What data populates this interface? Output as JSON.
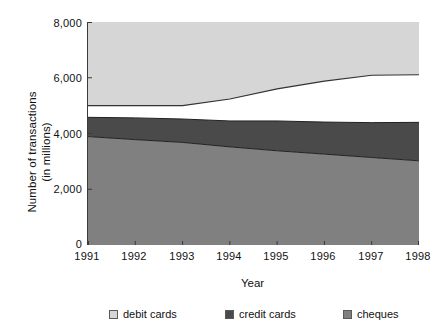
{
  "chart_data": {
    "type": "area",
    "stacked": true,
    "title": "",
    "xlabel": "Year",
    "ylabel": "Number of transactions\n(in millions)",
    "ylabel_line1": "Number of transactions",
    "ylabel_line2": "(in millions)",
    "categories": [
      "1991",
      "1992",
      "1993",
      "1994",
      "1995",
      "1996",
      "1997",
      "1998"
    ],
    "x": [
      1991,
      1992,
      1993,
      1994,
      1995,
      1996,
      1997,
      1998
    ],
    "ylim": [
      0,
      8000
    ],
    "yticks": [
      0,
      2000,
      4000,
      6000,
      8000
    ],
    "ytick_labels": [
      "0",
      "2,000",
      "4,000",
      "6,000",
      "8,000"
    ],
    "grid": false,
    "legend_position": "bottom",
    "stack_order_bottom_to_top": [
      "cheques",
      "credit cards",
      "debit cards"
    ],
    "series": [
      {
        "name": "cheques",
        "color": "#808080",
        "values": [
          3890,
          3780,
          3680,
          3520,
          3380,
          3260,
          3140,
          3020
        ]
      },
      {
        "name": "credit cards",
        "color": "#4a4a4a",
        "values": [
          690,
          780,
          840,
          930,
          1070,
          1150,
          1250,
          1380
        ]
      },
      {
        "name": "debit cards",
        "color": "#d6d6d6",
        "values": [
          420,
          440,
          480,
          790,
          1150,
          1470,
          1700,
          1710
        ]
      }
    ],
    "cumulative_tops": {
      "cheques": [
        3890,
        3780,
        3680,
        3520,
        3380,
        3260,
        3140,
        3020
      ],
      "cheques_plus_credit": [
        4580,
        4560,
        4520,
        4450,
        4450,
        4410,
        4390,
        4400
      ],
      "total": [
        5000,
        5000,
        5000,
        5240,
        5600,
        5880,
        6090,
        6110
      ]
    }
  },
  "axis": {
    "y_title_line1": "Number of transactions",
    "y_title_line2": "(in millions)",
    "x_title": "Year",
    "y_tick_labels": [
      "8,000",
      "6,000",
      "4,000",
      "2,000",
      "0"
    ],
    "x_tick_labels": [
      "1991",
      "1992",
      "1993",
      "1994",
      "1995",
      "1996",
      "1997",
      "1998"
    ]
  },
  "legend": {
    "items": [
      {
        "label": "debit cards",
        "color": "#d6d6d6"
      },
      {
        "label": "credit cards",
        "color": "#4a4a4a"
      },
      {
        "label": "cheques",
        "color": "#808080"
      }
    ]
  },
  "colors": {
    "debit_cards": "#d6d6d6",
    "credit_cards": "#4a4a4a",
    "cheques": "#808080",
    "axis": "#3a3a3a",
    "background": "#ffffff",
    "text": "#111111"
  }
}
